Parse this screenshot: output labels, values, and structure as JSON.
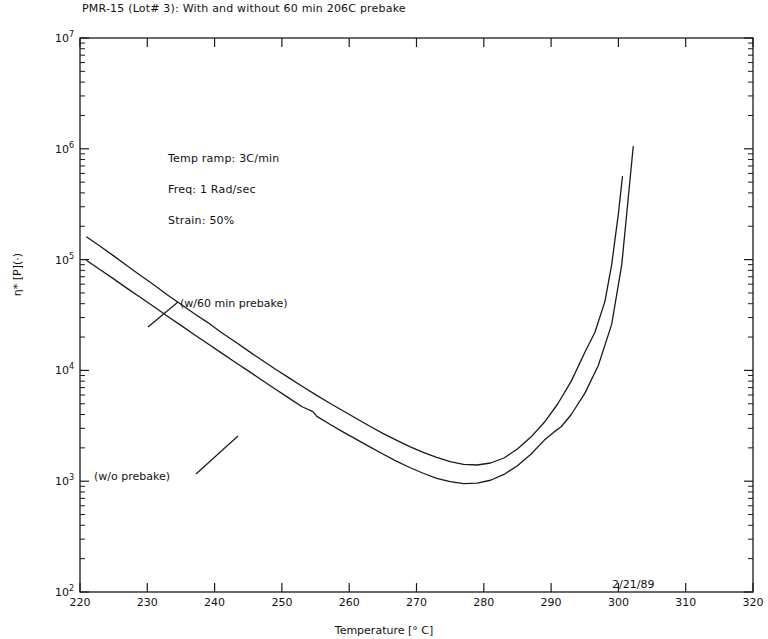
{
  "chart_data": {
    "type": "line",
    "title": "PMR-15 (Lot# 3): With and without 60 min 206C prebake",
    "xlabel": "Temperature [° C]",
    "ylabel": "η* [P](·)",
    "xlim": [
      220,
      320
    ],
    "ylim": [
      100,
      10000000
    ],
    "yscale": "log",
    "xscale": "linear",
    "grid": false,
    "legend": "inline-annotations",
    "xticks": [
      220,
      230,
      240,
      250,
      260,
      270,
      280,
      290,
      300,
      310,
      320
    ],
    "xtick_labels": [
      "220",
      "230",
      "240",
      "250",
      "260",
      "270",
      "280",
      "290",
      "300",
      "310",
      "320"
    ],
    "yticks": [
      100,
      1000,
      10000,
      100000,
      1000000,
      10000000
    ],
    "ytick_labels": [
      "10",
      "10",
      "10",
      "10",
      "10",
      "10"
    ],
    "ytick_exponents": [
      "2",
      "3",
      "4",
      "5",
      "6",
      "7"
    ],
    "yminor_ticks": true,
    "series": [
      {
        "name": "(w/60 min prebake)",
        "label_x": 238,
        "label_y": 31000,
        "x": [
          221.0,
          223.0,
          225.0,
          227.0,
          229.0,
          231.0,
          233.0,
          235.0,
          237.0,
          239.0,
          241.0,
          243.0,
          245.0,
          247.0,
          249.0,
          251.0,
          253.0,
          255.0,
          257.0,
          259.0,
          261.0,
          263.0,
          265.0,
          267.0,
          269.0,
          271.0,
          273.0,
          275.0,
          277.0,
          279.0,
          281.0,
          283.0,
          285.0,
          287.0,
          289.0,
          291.0,
          293.0,
          295.0,
          296.5,
          298.0,
          299.0,
          300.0,
          300.6
        ],
        "y": [
          160000,
          132000,
          108000,
          88000,
          72000,
          59000,
          48000,
          39500,
          32500,
          27000,
          22000,
          18200,
          15000,
          12400,
          10300,
          8600,
          7200,
          6050,
          5100,
          4350,
          3700,
          3150,
          2700,
          2350,
          2050,
          1820,
          1640,
          1500,
          1420,
          1400,
          1460,
          1620,
          1950,
          2500,
          3400,
          5000,
          8000,
          14500,
          22000,
          42000,
          90000,
          260000,
          560000
        ]
      },
      {
        "name": "(w/o prebake)",
        "label_x": 226,
        "label_y": 1050,
        "x": [
          221.0,
          223.0,
          225.0,
          227.0,
          229.0,
          231.0,
          233.0,
          235.0,
          237.0,
          239.0,
          241.0,
          243.0,
          245.0,
          247.0,
          249.0,
          251.0,
          253.0,
          254.6,
          255.2,
          257.0,
          259.0,
          261.0,
          263.0,
          265.0,
          267.0,
          269.0,
          271.0,
          273.0,
          275.0,
          277.0,
          279.0,
          281.0,
          283.0,
          285.0,
          287.0,
          289.0,
          290.5,
          291.5,
          293.0,
          295.0,
          297.0,
          299.0,
          300.5,
          301.5,
          302.2
        ],
        "y": [
          98000,
          81000,
          67000,
          55000,
          45500,
          37500,
          30800,
          25500,
          21000,
          17400,
          14400,
          11900,
          9900,
          8200,
          6800,
          5650,
          4700,
          4250,
          3850,
          3300,
          2800,
          2400,
          2050,
          1760,
          1520,
          1330,
          1180,
          1060,
          990,
          950,
          960,
          1020,
          1150,
          1380,
          1750,
          2350,
          2800,
          3100,
          4000,
          6200,
          11000,
          26000,
          90000,
          380000,
          1050000
        ]
      }
    ],
    "annotations": [
      {
        "id": "temp-ramp",
        "text": "Temp ramp: 3C/min"
      },
      {
        "id": "frequency",
        "text": "Freq: 1 Rad/sec"
      },
      {
        "id": "strain",
        "text": "Strain: 50%"
      }
    ],
    "datestamp": "2/21/89",
    "line_color": "#1a1a1a"
  }
}
